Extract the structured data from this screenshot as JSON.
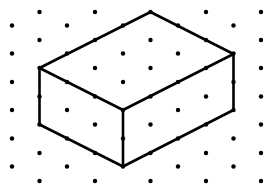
{
  "diagram": {
    "background_color": "#ffffff",
    "dot_color": "#000000",
    "line_color": "#000000",
    "dot_radius": 2.2,
    "line_width": 2.6,
    "grid": {
      "columns_x": [
        12,
        39.5,
        67,
        95,
        123,
        150.5,
        178,
        206,
        233.5,
        261
      ],
      "even_rows_y": [
        25.5,
        53.5,
        82,
        110,
        138.5,
        166.5
      ],
      "odd_rows_y": [
        12,
        40,
        68,
        96.5,
        124.5,
        153,
        181
      ]
    },
    "shape": {
      "name": "cuboid",
      "vertices": {
        "top_back": [
          150.5,
          12
        ],
        "left_top": [
          39.5,
          68
        ],
        "left_bottom": [
          39.5,
          124.5
        ],
        "front_top": [
          123,
          110
        ],
        "front_bottom": [
          123,
          166.5
        ],
        "right_top": [
          233.5,
          54
        ],
        "right_bottom": [
          233.5,
          110
        ]
      },
      "edges": [
        [
          "top_back",
          "left_top"
        ],
        [
          "top_back",
          "right_top"
        ],
        [
          "left_top",
          "front_top"
        ],
        [
          "right_top",
          "front_top"
        ],
        [
          "left_top",
          "left_bottom"
        ],
        [
          "front_top",
          "front_bottom"
        ],
        [
          "right_top",
          "right_bottom"
        ],
        [
          "left_bottom",
          "front_bottom"
        ],
        [
          "right_bottom",
          "front_bottom"
        ]
      ]
    }
  }
}
